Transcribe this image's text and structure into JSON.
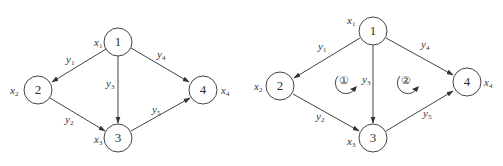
{
  "diagrams": [
    {
      "name": "graph-left",
      "nodes": [
        {
          "id": "1",
          "label": "1",
          "var": "x",
          "sub": "1"
        },
        {
          "id": "2",
          "label": "2",
          "var": "x",
          "sub": "2"
        },
        {
          "id": "3",
          "label": "3",
          "var": "x",
          "sub": "3"
        },
        {
          "id": "4",
          "label": "4",
          "var": "x",
          "sub": "4"
        }
      ],
      "edges": [
        {
          "from": "1",
          "to": "2",
          "var": "y",
          "sub": "1"
        },
        {
          "from": "2",
          "to": "3",
          "var": "y",
          "sub": "2"
        },
        {
          "from": "1",
          "to": "3",
          "var": "y",
          "sub": "3"
        },
        {
          "from": "1",
          "to": "4",
          "var": "y",
          "sub": "4"
        },
        {
          "from": "3",
          "to": "4",
          "var": "y",
          "sub": "5"
        }
      ]
    },
    {
      "name": "graph-right",
      "nodes": [
        {
          "id": "1",
          "label": "1",
          "var": "x",
          "sub": "1"
        },
        {
          "id": "2",
          "label": "2",
          "var": "x",
          "sub": "2"
        },
        {
          "id": "3",
          "label": "3",
          "var": "x",
          "sub": "3"
        },
        {
          "id": "4",
          "label": "4",
          "var": "x",
          "sub": "4"
        }
      ],
      "edges": [
        {
          "from": "1",
          "to": "2",
          "var": "y",
          "sub": "1"
        },
        {
          "from": "2",
          "to": "3",
          "var": "y",
          "sub": "2"
        },
        {
          "from": "1",
          "to": "3",
          "var": "y",
          "sub": "3"
        },
        {
          "from": "1",
          "to": "4",
          "var": "y",
          "sub": "4"
        },
        {
          "from": "3",
          "to": "4",
          "var": "y",
          "sub": "5"
        }
      ],
      "loops": [
        {
          "label": "①",
          "direction": "clockwise"
        },
        {
          "label": "②",
          "direction": "clockwise"
        }
      ]
    }
  ]
}
